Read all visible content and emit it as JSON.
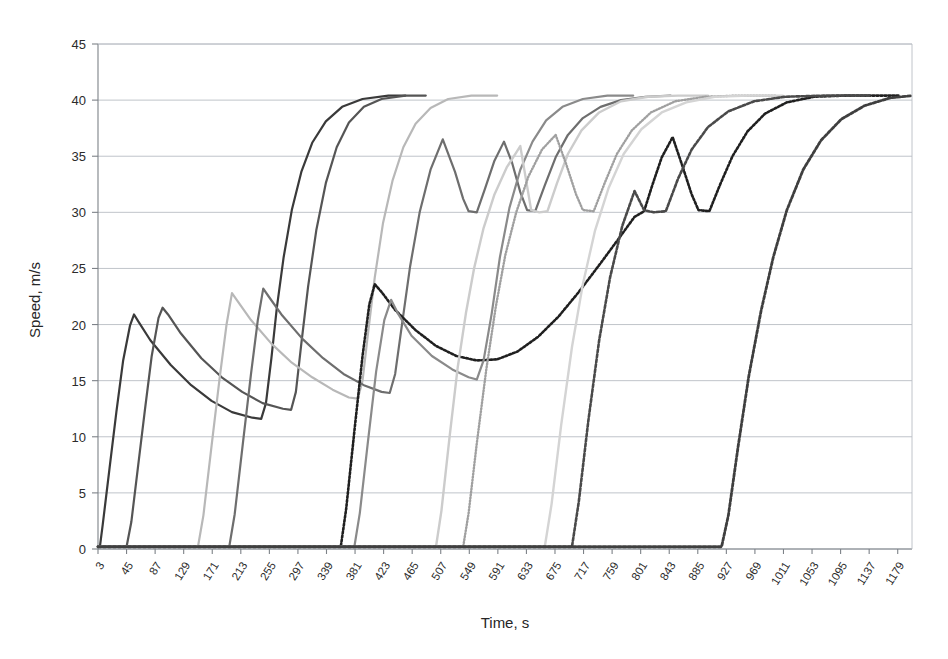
{
  "chart_data": {
    "type": "line",
    "title": "",
    "xlabel": "Time, s",
    "ylabel": "Speed, m/s",
    "xlim": [
      3,
      1200
    ],
    "ylim": [
      0,
      45
    ],
    "ytick_step": 5,
    "grid": true,
    "legend": "none",
    "yticks": [
      "0",
      "5",
      "10",
      "15",
      "20",
      "25",
      "30",
      "35",
      "40",
      "45"
    ],
    "xticks": [
      "3",
      "45",
      "87",
      "129",
      "171",
      "213",
      "255",
      "297",
      "339",
      "381",
      "423",
      "465",
      "507",
      "549",
      "591",
      "633",
      "675",
      "717",
      "759",
      "801",
      "843",
      "885",
      "927",
      "969",
      "1011",
      "1053",
      "1095",
      "1137",
      "1179"
    ],
    "series": [
      {
        "name": "vehicle-1",
        "color": "#3a3a3a",
        "width": 2.2,
        "dash": "none",
        "points": [
          [
            3,
            0.2
          ],
          [
            6,
            0.3
          ],
          [
            10,
            2.2
          ],
          [
            20,
            7.2
          ],
          [
            30,
            12.2
          ],
          [
            40,
            16.8
          ],
          [
            50,
            19.9
          ],
          [
            56,
            20.9
          ],
          [
            62,
            20.3
          ],
          [
            80,
            18.6
          ],
          [
            110,
            16.4
          ],
          [
            140,
            14.6
          ],
          [
            170,
            13.2
          ],
          [
            200,
            12.2
          ],
          [
            230,
            11.7
          ],
          [
            243,
            11.6
          ],
          [
            250,
            13.0
          ],
          [
            258,
            17.0
          ],
          [
            266,
            21.5
          ],
          [
            276,
            26.0
          ],
          [
            288,
            30.2
          ],
          [
            302,
            33.6
          ],
          [
            318,
            36.2
          ],
          [
            338,
            38.1
          ],
          [
            362,
            39.4
          ],
          [
            392,
            40.1
          ],
          [
            430,
            40.4
          ],
          [
            455,
            40.4
          ]
        ]
      },
      {
        "name": "vehicle-2",
        "color": "#555555",
        "width": 2.2,
        "dash": "none",
        "points": [
          [
            3,
            0.2
          ],
          [
            45,
            0.2
          ],
          [
            52,
            2.4
          ],
          [
            62,
            7.4
          ],
          [
            72,
            12.4
          ],
          [
            82,
            17.2
          ],
          [
            92,
            20.6
          ],
          [
            98,
            21.5
          ],
          [
            106,
            20.9
          ],
          [
            125,
            19.2
          ],
          [
            155,
            17.0
          ],
          [
            185,
            15.3
          ],
          [
            215,
            14.0
          ],
          [
            245,
            13.0
          ],
          [
            275,
            12.5
          ],
          [
            287,
            12.4
          ],
          [
            294,
            14.0
          ],
          [
            302,
            18.3
          ],
          [
            312,
            23.4
          ],
          [
            324,
            28.4
          ],
          [
            338,
            32.6
          ],
          [
            354,
            35.8
          ],
          [
            372,
            38.0
          ],
          [
            394,
            39.4
          ],
          [
            420,
            40.1
          ],
          [
            455,
            40.4
          ],
          [
            485,
            40.4
          ]
        ]
      },
      {
        "name": "vehicle-3",
        "color": "#b8b8b8",
        "width": 2.2,
        "dash": "none",
        "points": [
          [
            3,
            0.2
          ],
          [
            150,
            0.2
          ],
          [
            158,
            3.0
          ],
          [
            170,
            9.2
          ],
          [
            182,
            15.3
          ],
          [
            192,
            20.0
          ],
          [
            200,
            22.8
          ],
          [
            208,
            22.1
          ],
          [
            228,
            20.4
          ],
          [
            258,
            18.3
          ],
          [
            288,
            16.6
          ],
          [
            318,
            15.3
          ],
          [
            348,
            14.2
          ],
          [
            372,
            13.5
          ],
          [
            385,
            13.4
          ],
          [
            392,
            15.0
          ],
          [
            400,
            19.2
          ],
          [
            410,
            24.2
          ],
          [
            422,
            29.0
          ],
          [
            436,
            32.8
          ],
          [
            452,
            35.8
          ],
          [
            470,
            37.9
          ],
          [
            492,
            39.3
          ],
          [
            518,
            40.1
          ],
          [
            552,
            40.4
          ],
          [
            590,
            40.4
          ]
        ]
      },
      {
        "name": "vehicle-4",
        "color": "#6e6e6e",
        "width": 2.2,
        "dash": "none",
        "points": [
          [
            3,
            0.2
          ],
          [
            196,
            0.2
          ],
          [
            204,
            3.1
          ],
          [
            216,
            9.4
          ],
          [
            228,
            15.6
          ],
          [
            238,
            20.4
          ],
          [
            246,
            23.2
          ],
          [
            254,
            22.5
          ],
          [
            274,
            20.8
          ],
          [
            304,
            18.7
          ],
          [
            334,
            17.0
          ],
          [
            364,
            15.6
          ],
          [
            394,
            14.6
          ],
          [
            420,
            14.0
          ],
          [
            432,
            13.9
          ],
          [
            440,
            15.6
          ],
          [
            450,
            20.0
          ],
          [
            462,
            25.2
          ],
          [
            476,
            30.0
          ],
          [
            492,
            33.8
          ],
          [
            510,
            36.5
          ],
          [
            528,
            33.6
          ],
          [
            540,
            31.2
          ],
          [
            548,
            30.1
          ],
          [
            560,
            30.0
          ],
          [
            572,
            32.1
          ],
          [
            586,
            34.6
          ],
          [
            600,
            36.3
          ],
          [
            612,
            34.4
          ],
          [
            624,
            31.8
          ],
          [
            634,
            30.2
          ],
          [
            646,
            30.1
          ],
          [
            660,
            32.4
          ],
          [
            676,
            34.9
          ],
          [
            694,
            36.9
          ],
          [
            716,
            38.4
          ],
          [
            742,
            39.4
          ],
          [
            772,
            40.0
          ],
          [
            808,
            40.3
          ],
          [
            845,
            40.4
          ]
        ]
      },
      {
        "name": "vehicle-5",
        "color": "#202020",
        "width": 2.6,
        "dash": "2,2",
        "points": [
          [
            3,
            0.2
          ],
          [
            360,
            0.2
          ],
          [
            368,
            3.6
          ],
          [
            380,
            10.5
          ],
          [
            392,
            17.2
          ],
          [
            402,
            21.8
          ],
          [
            410,
            23.6
          ],
          [
            420,
            22.9
          ],
          [
            440,
            21.3
          ],
          [
            470,
            19.5
          ],
          [
            500,
            18.1
          ],
          [
            530,
            17.2
          ],
          [
            560,
            16.8
          ],
          [
            590,
            16.9
          ],
          [
            620,
            17.6
          ],
          [
            650,
            18.9
          ],
          [
            680,
            20.7
          ],
          [
            710,
            22.9
          ],
          [
            740,
            25.3
          ],
          [
            768,
            27.6
          ],
          [
            792,
            29.6
          ],
          [
            806,
            30.1
          ],
          [
            818,
            32.4
          ],
          [
            832,
            34.9
          ],
          [
            848,
            36.7
          ],
          [
            862,
            34.2
          ],
          [
            876,
            31.6
          ],
          [
            886,
            30.2
          ],
          [
            902,
            30.1
          ],
          [
            918,
            32.5
          ],
          [
            936,
            35.0
          ],
          [
            958,
            37.2
          ],
          [
            984,
            38.8
          ],
          [
            1016,
            39.8
          ],
          [
            1056,
            40.3
          ],
          [
            1100,
            40.4
          ],
          [
            1180,
            40.4
          ]
        ]
      },
      {
        "name": "vehicle-6",
        "color": "#8a8a8a",
        "width": 2.2,
        "dash": "none",
        "points": [
          [
            3,
            0.2
          ],
          [
            380,
            0.2
          ],
          [
            388,
            3.2
          ],
          [
            400,
            9.6
          ],
          [
            412,
            15.8
          ],
          [
            424,
            20.4
          ],
          [
            434,
            22.2
          ],
          [
            444,
            21.0
          ],
          [
            464,
            19.0
          ],
          [
            494,
            17.2
          ],
          [
            524,
            16.0
          ],
          [
            548,
            15.3
          ],
          [
            560,
            15.1
          ],
          [
            570,
            16.8
          ],
          [
            582,
            21.0
          ],
          [
            594,
            26.0
          ],
          [
            608,
            30.4
          ],
          [
            624,
            33.8
          ],
          [
            642,
            36.3
          ],
          [
            662,
            38.2
          ],
          [
            686,
            39.4
          ],
          [
            716,
            40.1
          ],
          [
            752,
            40.4
          ],
          [
            790,
            40.4
          ]
        ]
      },
      {
        "name": "vehicle-7",
        "color": "#cccccc",
        "width": 2.4,
        "dash": "none",
        "points": [
          [
            3,
            0.2
          ],
          [
            500,
            0.2
          ],
          [
            508,
            3.4
          ],
          [
            520,
            10.0
          ],
          [
            532,
            16.2
          ],
          [
            544,
            21.0
          ],
          [
            556,
            25.0
          ],
          [
            570,
            28.6
          ],
          [
            586,
            31.6
          ],
          [
            604,
            34.0
          ],
          [
            624,
            35.9
          ],
          [
            640,
            30.2
          ],
          [
            652,
            30.0
          ],
          [
            664,
            30.1
          ],
          [
            678,
            32.6
          ],
          [
            694,
            35.2
          ],
          [
            714,
            37.3
          ],
          [
            740,
            38.9
          ],
          [
            772,
            39.9
          ],
          [
            812,
            40.3
          ],
          [
            856,
            40.4
          ],
          [
            900,
            40.4
          ]
        ]
      },
      {
        "name": "vehicle-8",
        "color": "#a0a0a0",
        "width": 2.4,
        "dash": "1,2",
        "points": [
          [
            3,
            0.2
          ],
          [
            540,
            0.2
          ],
          [
            548,
            3.2
          ],
          [
            560,
            9.4
          ],
          [
            574,
            16.0
          ],
          [
            588,
            21.6
          ],
          [
            602,
            26.2
          ],
          [
            618,
            30.0
          ],
          [
            636,
            33.2
          ],
          [
            656,
            35.6
          ],
          [
            676,
            36.9
          ],
          [
            692,
            34.2
          ],
          [
            706,
            31.6
          ],
          [
            716,
            30.2
          ],
          [
            732,
            30.1
          ],
          [
            748,
            32.6
          ],
          [
            766,
            35.2
          ],
          [
            788,
            37.3
          ],
          [
            816,
            38.9
          ],
          [
            852,
            39.9
          ],
          [
            896,
            40.3
          ],
          [
            944,
            40.4
          ],
          [
            1000,
            40.4
          ]
        ]
      },
      {
        "name": "vehicle-9",
        "color": "#d4d4d4",
        "width": 2.4,
        "dash": "none",
        "points": [
          [
            3,
            0.2
          ],
          [
            660,
            0.2
          ],
          [
            670,
            4.0
          ],
          [
            684,
            11.0
          ],
          [
            700,
            18.0
          ],
          [
            716,
            23.6
          ],
          [
            734,
            28.4
          ],
          [
            754,
            32.2
          ],
          [
            776,
            35.2
          ],
          [
            802,
            37.4
          ],
          [
            832,
            38.9
          ],
          [
            868,
            39.8
          ],
          [
            910,
            40.3
          ],
          [
            960,
            40.4
          ],
          [
            1010,
            40.4
          ]
        ]
      },
      {
        "name": "vehicle-10",
        "color": "#4a4a4a",
        "width": 2.6,
        "dash": "3,2",
        "points": [
          [
            3,
            0.2
          ],
          [
            700,
            0.2
          ],
          [
            710,
            4.2
          ],
          [
            724,
            11.4
          ],
          [
            740,
            18.6
          ],
          [
            756,
            24.2
          ],
          [
            774,
            28.8
          ],
          [
            792,
            31.9
          ],
          [
            806,
            30.2
          ],
          [
            820,
            30.0
          ],
          [
            838,
            30.1
          ],
          [
            856,
            33.0
          ],
          [
            876,
            35.6
          ],
          [
            900,
            37.6
          ],
          [
            930,
            39.0
          ],
          [
            968,
            39.9
          ],
          [
            1014,
            40.3
          ],
          [
            1070,
            40.4
          ],
          [
            1140,
            40.4
          ]
        ]
      },
      {
        "name": "vehicle-11",
        "color": "#3f3f3f",
        "width": 2.8,
        "dash": "3,2",
        "points": [
          [
            3,
            0.2
          ],
          [
            920,
            0.2
          ],
          [
            930,
            3.0
          ],
          [
            944,
            9.0
          ],
          [
            960,
            15.4
          ],
          [
            978,
            21.2
          ],
          [
            996,
            26.0
          ],
          [
            1016,
            30.2
          ],
          [
            1040,
            33.8
          ],
          [
            1066,
            36.4
          ],
          [
            1096,
            38.3
          ],
          [
            1130,
            39.5
          ],
          [
            1168,
            40.2
          ],
          [
            1200,
            40.4
          ]
        ]
      }
    ]
  }
}
